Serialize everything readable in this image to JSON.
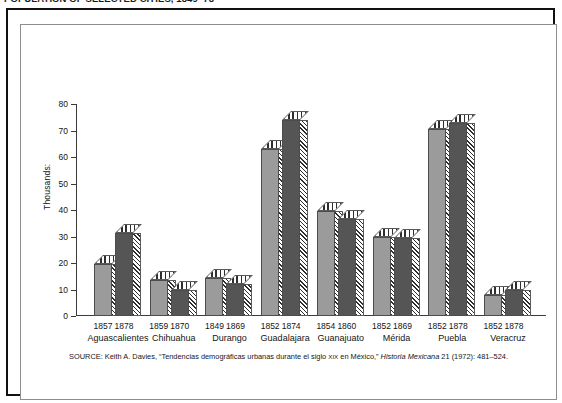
{
  "top_caption": "POPULATION OF SELECTED CITIES, 1849–78",
  "figure": {
    "ylabel": "Thousands:",
    "source_prefix": "SOURCE: Keith A. Davies, “Tendencias demográficas urbanas durante el siglo ",
    "source_smallcaps": "XIX",
    "source_mid": " en México,” ",
    "source_italic": "Historia Mexicana",
    "source_suffix": " 21 (1972): 481–524.",
    "source_full": "SOURCE: Keith A. Davies, “Tendencias demográficas urbanas durante el siglo XIX en México,” Historia Mexicana 21 (1972): 481–524."
  },
  "colors": {
    "bar_light": "#9b9b9b",
    "bar_dark": "#555555",
    "hatch": "#2e2e2e",
    "axis": "#3b3b3b",
    "frame_outer": "#111111",
    "frame_inner": "#8d8d8d",
    "background": "#ffffff"
  },
  "chart_data": {
    "type": "bar",
    "title": "POPULATION OF SELECTED CITIES, 1849–78",
    "xlabel": "",
    "ylabel": "Thousands:",
    "ylim": [
      0,
      80
    ],
    "yticks": [
      0,
      10,
      20,
      30,
      40,
      50,
      60,
      70,
      80
    ],
    "ytick_labels": [
      "0",
      "10",
      "20",
      "30",
      "40",
      "50",
      "60",
      "70",
      "80"
    ],
    "grid": false,
    "legend": "none",
    "categories": [
      "Aguascalientes",
      "Chihuahua",
      "Durango",
      "Guadalajara",
      "Guanajuato",
      "Mérida",
      "Puebla",
      "Veracruz"
    ],
    "groups": [
      {
        "city": "Aguascalientes",
        "bars": [
          {
            "year": "1857",
            "value": 19.5,
            "shade": "light"
          },
          {
            "year": "1878",
            "value": 31.5,
            "shade": "dark"
          }
        ]
      },
      {
        "city": "Chihuahua",
        "bars": [
          {
            "year": "1859",
            "value": 13.5,
            "shade": "light"
          },
          {
            "year": "1870",
            "value": 10.0,
            "shade": "dark"
          }
        ]
      },
      {
        "city": "Durango",
        "bars": [
          {
            "year": "1849",
            "value": 14.5,
            "shade": "light"
          },
          {
            "year": "1869",
            "value": 12.0,
            "shade": "dark"
          }
        ]
      },
      {
        "city": "Guadalajara",
        "bars": [
          {
            "year": "1852",
            "value": 63.0,
            "shade": "light"
          },
          {
            "year": "1874",
            "value": 74.0,
            "shade": "dark"
          }
        ]
      },
      {
        "city": "Guanajuato",
        "bars": [
          {
            "year": "1854",
            "value": 39.5,
            "shade": "light"
          },
          {
            "year": "1860",
            "value": 36.5,
            "shade": "dark"
          }
        ]
      },
      {
        "city": "Mérida",
        "bars": [
          {
            "year": "1852",
            "value": 30.0,
            "shade": "light"
          },
          {
            "year": "1869",
            "value": 29.5,
            "shade": "dark"
          }
        ]
      },
      {
        "city": "Puebla",
        "bars": [
          {
            "year": "1852",
            "value": 70.5,
            "shade": "light"
          },
          {
            "year": "1878",
            "value": 73.0,
            "shade": "dark"
          }
        ]
      },
      {
        "city": "Veracruz",
        "bars": [
          {
            "year": "1852",
            "value": 8.0,
            "shade": "light"
          },
          {
            "year": "1878",
            "value": 10.0,
            "shade": "dark"
          }
        ]
      }
    ]
  }
}
